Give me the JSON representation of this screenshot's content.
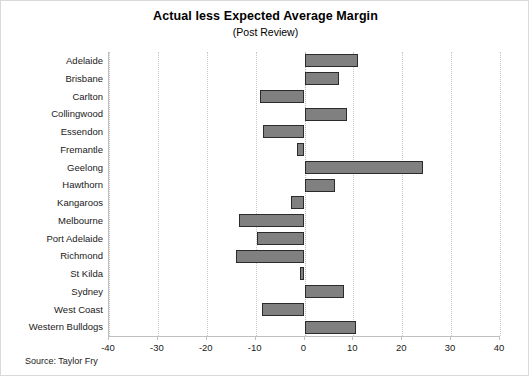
{
  "chart_data": {
    "type": "bar",
    "orientation": "horizontal",
    "title": "Actual less Expected Average Margin",
    "subtitle": "(Post Review)",
    "xlabel": "",
    "ylabel": "",
    "xlim": [
      -40,
      40
    ],
    "xticks": [
      -40,
      -30,
      -20,
      -10,
      0,
      10,
      20,
      30,
      40
    ],
    "xtick_labels": [
      "-40",
      "-30",
      "-20",
      "-10",
      "0",
      "10",
      "20",
      "30",
      "40"
    ],
    "grid": "vertical-dotted",
    "legend": null,
    "bar_color": "#808080",
    "bar_edge_color": "#2b2b2b",
    "categories": [
      "Adelaide",
      "Brisbane",
      "Carlton",
      "Collingwood",
      "Essendon",
      "Fremantle",
      "Geelong",
      "Hawthorn",
      "Kangaroos",
      "Melbourne",
      "Port Adelaide",
      "Richmond",
      "St Kilda",
      "Sydney",
      "West Coast",
      "Western Bulldogs"
    ],
    "values": [
      11.0,
      7.0,
      -9.2,
      8.6,
      -8.4,
      -1.5,
      24.3,
      6.3,
      -2.7,
      -13.3,
      -9.8,
      -14.0,
      -1.0,
      8.0,
      -8.6,
      10.5
    ]
  },
  "source_note": "Source: Taylor Fry"
}
